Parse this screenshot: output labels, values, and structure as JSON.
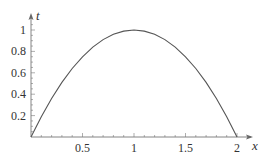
{
  "chart_data": {
    "type": "line",
    "title": "",
    "xlabel": "x",
    "ylabel": "t",
    "xlim": [
      0,
      2.1
    ],
    "ylim": [
      0,
      1.1
    ],
    "grid": false,
    "legend": null,
    "x_ticks": [
      0.5,
      1,
      1.5,
      2
    ],
    "x_tick_labels": [
      "0.5",
      "1",
      "1.5",
      "2"
    ],
    "y_ticks": [
      0.2,
      0.4,
      0.6,
      0.8,
      1
    ],
    "y_tick_labels": [
      "0.2",
      "0.4",
      "0.6",
      "0.8",
      "1"
    ],
    "series": [
      {
        "name": "t(x)",
        "x": [
          0,
          0.1,
          0.2,
          0.3,
          0.4,
          0.5,
          0.6,
          0.7,
          0.8,
          0.9,
          1.0,
          1.1,
          1.2,
          1.3,
          1.4,
          1.5,
          1.6,
          1.7,
          1.8,
          1.9,
          2.0
        ],
        "values": [
          0,
          0.19,
          0.36,
          0.51,
          0.64,
          0.75,
          0.84,
          0.91,
          0.96,
          0.99,
          1.0,
          0.99,
          0.96,
          0.91,
          0.84,
          0.75,
          0.64,
          0.51,
          0.36,
          0.19,
          0
        ],
        "color": "#555555"
      }
    ]
  }
}
